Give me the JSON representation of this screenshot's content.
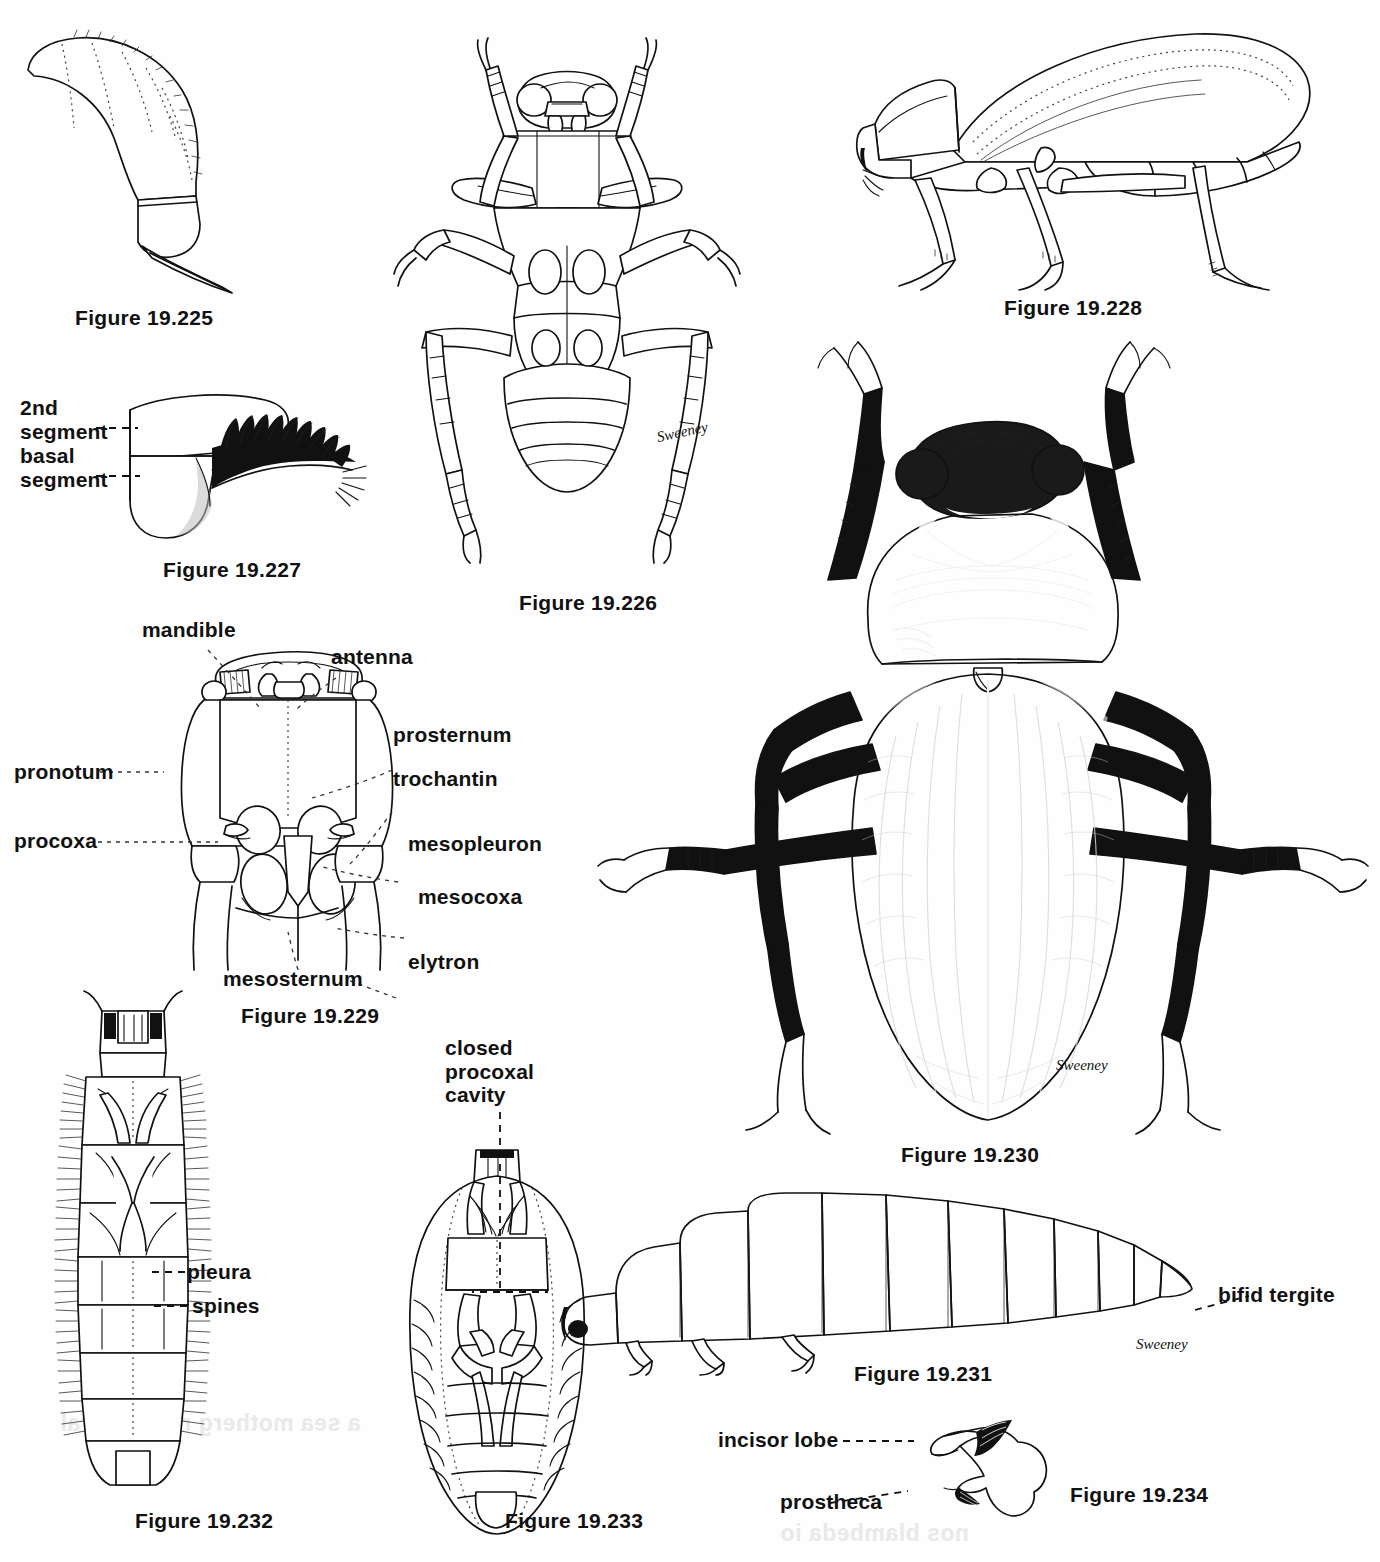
{
  "plate": {
    "background_color": "#fefefe",
    "ink_color": "#111111",
    "artist_signature": "Sweeney"
  },
  "figures": [
    {
      "id": "19.225",
      "caption": "Figure 19.225",
      "subject": "beetle tarsal claw / curved segmented appendage, lateral view",
      "labels": []
    },
    {
      "id": "19.226",
      "caption": "Figure 19.226",
      "subject": "beetle ventral habitus, line drawing",
      "labels": []
    },
    {
      "id": "19.227",
      "caption": "Figure 19.227",
      "subject": "antennal segments with comb of setae",
      "labels": [
        "2nd segment",
        "basal segment"
      ]
    },
    {
      "id": "19.228",
      "caption": "Figure 19.228",
      "subject": "beetle lateral habitus, line drawing",
      "labels": []
    },
    {
      "id": "19.229",
      "caption": "Figure 19.229",
      "subject": "beetle prothorax and mesothorax, ventral view, labelled",
      "labels": [
        "mandible",
        "antenna",
        "prosternum",
        "trochantin",
        "pronotum",
        "procoxa",
        "mesopleuron",
        "mesocoxa",
        "elytron",
        "mesosternum"
      ]
    },
    {
      "id": "19.230",
      "caption": "Figure 19.230",
      "subject": "darkling beetle dorsal habitus, stipple/ink rendering",
      "labels": []
    },
    {
      "id": "19.231",
      "caption": "Figure 19.231",
      "subject": "beetle larva, lateral view",
      "labels": [
        "bifid tergite"
      ]
    },
    {
      "id": "19.232",
      "caption": "Figure 19.232",
      "subject": "beetle larva, dorsal view with lateral spines",
      "labels": [
        "pleura",
        "spines"
      ]
    },
    {
      "id": "19.233",
      "caption": "Figure 19.233",
      "subject": "beetle pupa, ventral view",
      "labels": [
        "closed procoxal cavity"
      ]
    },
    {
      "id": "19.234",
      "caption": "Figure 19.234",
      "subject": "larval mandible",
      "labels": [
        "incisor lobe",
        "prostheca"
      ]
    }
  ],
  "captions": {
    "f225": "Figure 19.225",
    "f226": "Figure 19.226",
    "f227": "Figure 19.227",
    "f228": "Figure 19.228",
    "f229": "Figure 19.229",
    "f230": "Figure 19.230",
    "f231": "Figure 19.231",
    "f232": "Figure 19.232",
    "f233": "Figure 19.233",
    "f234": "Figure 19.234"
  },
  "labels": {
    "second_segment": "2nd\nsegment",
    "basal_segment": "basal\nsegment",
    "mandible": "mandible",
    "antenna": "antenna",
    "prosternum": "prosternum",
    "trochantin": "trochantin",
    "pronotum": "pronotum",
    "procoxa": "procoxa",
    "mesopleuron": "mesopleuron",
    "mesocoxa": "mesocoxa",
    "elytron": "elytron",
    "mesosternum": "mesosternum",
    "pleura": "pleura",
    "spines": "spines",
    "closed_procoxal_cavity": "closed\nprocoxal\ncavity",
    "bifid_tergite": "bifid tergite",
    "incisor_lobe": "incisor lobe",
    "prostheca": "prostheca"
  },
  "signatures": {
    "beetle_230": "Sweeney",
    "larva_231": "Sweeney",
    "ventral_226": "Sweeney"
  }
}
